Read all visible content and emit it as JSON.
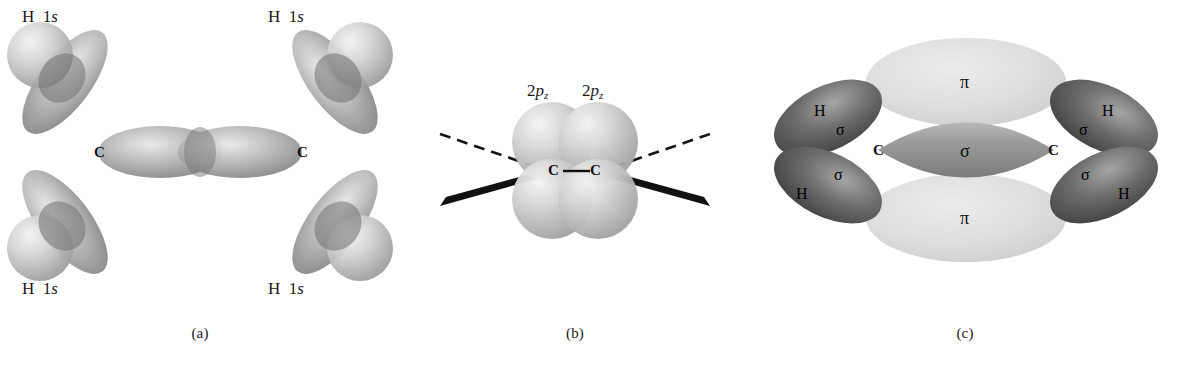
{
  "figure": {
    "background_color": "#ffffff",
    "panels": [
      {
        "id": "a",
        "caption": "(a)",
        "description": "sp2 hybrid orbitals on two carbon atoms overlapping with four hydrogen 1s orbitals",
        "atom_labels": [
          "C",
          "C"
        ],
        "orbital_labels": [
          {
            "element": "H",
            "orbital": "1s",
            "position": "top-left"
          },
          {
            "element": "H",
            "orbital": "1s",
            "position": "top-right"
          },
          {
            "element": "H",
            "orbital": "1s",
            "position": "bottom-left"
          },
          {
            "element": "H",
            "orbital": "1s",
            "position": "bottom-right"
          }
        ],
        "element_symbol": "H",
        "orbital_name": "1",
        "orbital_italic": "s"
      },
      {
        "id": "b",
        "caption": "(b)",
        "description": "Two 2pz orbitals perpendicular to the molecular plane on adjacent carbons",
        "atom_labels": [
          "C",
          "C"
        ],
        "orbital_label_prefix": "2",
        "orbital_label_italic": "p",
        "orbital_label_sub": "z",
        "bond_styles": [
          "dashed",
          "wedge"
        ]
      },
      {
        "id": "c",
        "caption": "(c)",
        "description": "Sigma bond framework and pi bond above and below the molecular plane",
        "atom_labels": [
          "C",
          "C"
        ],
        "sigma_symbol": "σ",
        "pi_symbol": "π",
        "hydrogen_symbol": "H",
        "sigma_label_count": 5,
        "pi_label_count": 2
      }
    ],
    "colors": {
      "lobe_mid": "#9a9a9a",
      "lobe_light": "#d8d8d8",
      "lobe_dark": "#4e4e4e",
      "pi_lobe": "#d9d9d9",
      "sphere": "#c9c9c9",
      "bond_line": "#111111",
      "text": "#1a1a1a"
    }
  }
}
